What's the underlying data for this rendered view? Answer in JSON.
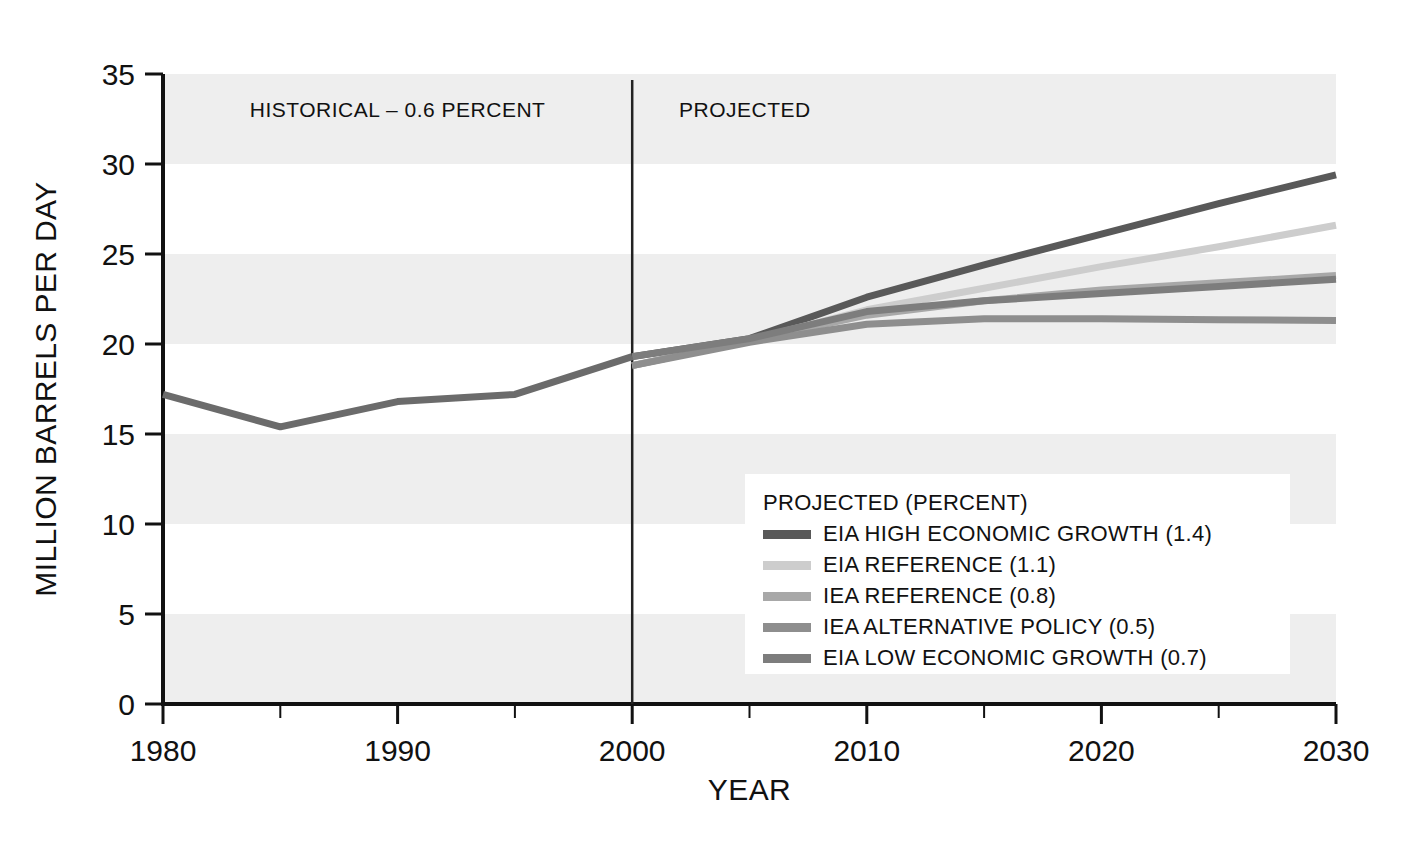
{
  "chart_data": {
    "type": "line",
    "title": "",
    "xlabel": "YEAR",
    "ylabel": "MILLION BARRELS PER DAY",
    "xlim": [
      1980,
      2030
    ],
    "ylim": [
      0,
      35
    ],
    "x_ticks": [
      1980,
      1990,
      2000,
      2010,
      2020,
      2030
    ],
    "x_minor_ticks": [
      1985,
      1995,
      2005,
      2015,
      2025
    ],
    "y_ticks": [
      0,
      5,
      10,
      15,
      20,
      25,
      30,
      35
    ],
    "grid": "horizontal-bands",
    "legend_position": "inside-lower-right",
    "annotations": [
      {
        "name": "historical",
        "text": "HISTORICAL – 0.6 PERCENT",
        "x": 1990.0,
        "y": 32.6
      },
      {
        "name": "projected",
        "text": "PROJECTED",
        "x": 2002.0,
        "y": 32.6
      }
    ],
    "divider_year": 2000,
    "legend_title": "PROJECTED (PERCENT)",
    "series": [
      {
        "name": "HISTORICAL",
        "label": "HISTORICAL",
        "color": "#6b6b6b",
        "x": [
          1980,
          1985,
          1990,
          1995,
          2000
        ],
        "values": [
          17.2,
          15.4,
          16.8,
          17.2,
          19.3
        ]
      },
      {
        "name": "EIA HIGH ECONOMIC GROWTH",
        "label": "EIA HIGH ECONOMIC GROWTH (1.4)",
        "rate": 1.4,
        "color": "#595959",
        "x": [
          2000,
          2005,
          2010,
          2015,
          2020,
          2025,
          2030
        ],
        "values": [
          19.3,
          20.3,
          22.6,
          24.4,
          26.1,
          27.8,
          29.4
        ]
      },
      {
        "name": "EIA REFERENCE",
        "label": "EIA REFERENCE (1.1)",
        "rate": 1.1,
        "color": "#cdcdcd",
        "x": [
          2000,
          2005,
          2010,
          2015,
          2020,
          2025,
          2030
        ],
        "values": [
          18.8,
          20.2,
          21.9,
          23.1,
          24.3,
          25.4,
          26.6
        ]
      },
      {
        "name": "IEA REFERENCE",
        "label": "IEA REFERENCE (0.8)",
        "rate": 0.8,
        "color": "#a8a8a8",
        "x": [
          2000,
          2005,
          2010,
          2015,
          2020,
          2025,
          2030
        ],
        "values": [
          18.8,
          20.2,
          21.6,
          22.4,
          23.0,
          23.4,
          23.8
        ]
      },
      {
        "name": "IEA ALTERNATIVE POLICY",
        "label": "IEA ALTERNATIVE POLICY (0.5)",
        "rate": 0.5,
        "color": "#8e8e8e",
        "x": [
          2000,
          2005,
          2010,
          2015,
          2020,
          2025,
          2030
        ],
        "values": [
          18.8,
          20.1,
          21.1,
          21.4,
          21.4,
          21.35,
          21.3
        ]
      },
      {
        "name": "EIA LOW ECONOMIC GROWTH",
        "label": "EIA LOW ECONOMIC GROWTH (0.7)",
        "rate": 0.7,
        "color": "#7d7d7d",
        "x": [
          2000,
          2005,
          2010,
          2015,
          2020,
          2025,
          2030
        ],
        "values": [
          19.3,
          20.3,
          21.8,
          22.4,
          22.8,
          23.2,
          23.6
        ]
      }
    ],
    "legend_entries": [
      {
        "label": "EIA HIGH ECONOMIC GROWTH (1.4)",
        "color": "#595959"
      },
      {
        "label": "EIA REFERENCE (1.1)",
        "color": "#cdcdcd"
      },
      {
        "label": "IEA REFERENCE (0.8)",
        "color": "#a8a8a8"
      },
      {
        "label": "IEA ALTERNATIVE POLICY (0.5)",
        "color": "#8e8e8e"
      },
      {
        "label": "EIA LOW ECONOMIC GROWTH (0.7)",
        "color": "#7d7d7d"
      }
    ],
    "band_color": "#eeeeee",
    "axis_color": "#111111",
    "background": "#ffffff"
  }
}
